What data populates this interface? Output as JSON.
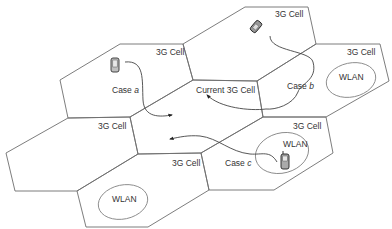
{
  "diagram": {
    "type": "cellular-handover",
    "cells": [
      {
        "id": "top",
        "label": "3G Cell"
      },
      {
        "id": "upper-left",
        "label": "3G Cell"
      },
      {
        "id": "current",
        "label": "Current 3G Cell"
      },
      {
        "id": "right",
        "label": "3G Cell"
      },
      {
        "id": "left",
        "label": "3G Cell"
      },
      {
        "id": "lower-right",
        "label": "3G Cell"
      },
      {
        "id": "lower-mid",
        "label": "3G Cell"
      },
      {
        "id": "bottom-left",
        "label": ""
      }
    ],
    "wlans": [
      {
        "id": "wlan-right",
        "label": "WLAN"
      },
      {
        "id": "wlan-lower-right",
        "label": "WLAN"
      },
      {
        "id": "wlan-bottom",
        "label": "WLAN"
      }
    ],
    "cases": [
      {
        "id": "case-a",
        "prefix": "Case ",
        "letter": "a"
      },
      {
        "id": "case-b",
        "prefix": "Case ",
        "letter": "b"
      },
      {
        "id": "case-c",
        "prefix": "Case ",
        "letter": "c"
      }
    ],
    "icons": [
      "mobile-phone-icon",
      "mobile-phone-icon",
      "mobile-phone-icon"
    ]
  }
}
